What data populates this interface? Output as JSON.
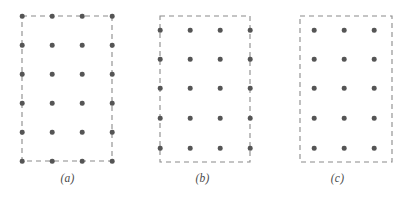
{
  "figure": {
    "type": "diagram",
    "background_color": "#ffffff",
    "dot_color": "#555555",
    "dash_color": "#8a8a8a",
    "dot_diameter_px": 4.6,
    "dash_pattern": "5 4",
    "dash_stroke_width": 1.1
  },
  "panels": [
    {
      "id": "a",
      "caption": "(a)",
      "offset_x": 0,
      "grid": {
        "columns": 4,
        "rows": 6,
        "x_positions": [
          22,
          52,
          82,
          112
        ],
        "y_positions": [
          16,
          45,
          74,
          103,
          132,
          161
        ]
      },
      "boundary": {
        "x": 22,
        "y": 16,
        "width": 90,
        "height": 145,
        "relation": "passes through perimeter dots"
      }
    },
    {
      "id": "b",
      "caption": "(b)",
      "offset_x": 135,
      "grid": {
        "columns": 4,
        "rows": 5,
        "x_positions": [
          25,
          55,
          85,
          115
        ],
        "y_positions": [
          30,
          59,
          88,
          118,
          148
        ]
      },
      "boundary": {
        "x": 25,
        "y": 16,
        "width": 90,
        "height": 146,
        "relation": "passes through left and right columns, clears top and bottom rows"
      }
    },
    {
      "id": "c",
      "caption": "(c)",
      "offset_x": 270,
      "grid": {
        "columns": 3,
        "rows": 5,
        "x_positions": [
          44,
          74,
          104
        ],
        "y_positions": [
          30,
          59,
          88,
          118,
          148
        ]
      },
      "boundary": {
        "x": 30,
        "y": 16,
        "width": 92,
        "height": 146,
        "relation": "fully encloses all dots with margin"
      }
    }
  ]
}
